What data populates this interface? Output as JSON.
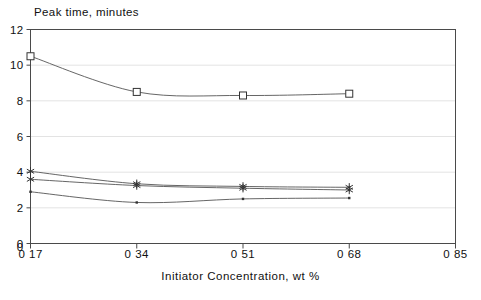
{
  "chart_data": {
    "type": "line",
    "title": "Peak time, minutes",
    "xlabel": "Initiator Concentration, wt %",
    "ylabel": "Peak time, minutes",
    "xlim": [
      0.17,
      0.85
    ],
    "ylim": [
      0,
      12
    ],
    "grid": true,
    "legend": "none",
    "x_tick_labels": [
      "0 17",
      "0 34",
      "0 51",
      "0 68",
      "0 85"
    ],
    "x_tick_values": [
      0.17,
      0.34,
      0.51,
      0.68,
      0.85
    ],
    "y_tick_labels": [
      "0",
      "2",
      "4",
      "6",
      "8",
      "10",
      "12"
    ],
    "y_tick_values": [
      0,
      2,
      4,
      6,
      8,
      10,
      12
    ],
    "y_origin_label": "0",
    "x": [
      0.17,
      0.34,
      0.51,
      0.68
    ],
    "series": [
      {
        "name": "series-1",
        "marker": "open-square",
        "values": [
          10.5,
          8.5,
          8.3,
          8.4
        ]
      },
      {
        "name": "series-2",
        "marker": "asterisk",
        "values": [
          4.05,
          3.35,
          3.2,
          3.15
        ]
      },
      {
        "name": "series-3",
        "marker": "asterisk",
        "values": [
          3.6,
          3.25,
          3.1,
          3.0
        ]
      },
      {
        "name": "series-4",
        "marker": "dot",
        "values": [
          2.9,
          2.3,
          2.5,
          2.55
        ]
      }
    ],
    "colors": {
      "axis": "#4a4a4a",
      "grid": "#dcdcdc",
      "line": "#555555",
      "marker": "#333333",
      "text": "#111111",
      "background": "#ffffff"
    }
  }
}
